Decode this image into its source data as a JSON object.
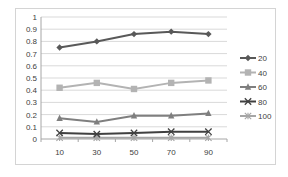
{
  "chart_data": {
    "type": "line",
    "title": "",
    "xlabel": "",
    "ylabel": "",
    "categories": [
      "10",
      "30",
      "50",
      "70",
      "90"
    ],
    "ylim": [
      0,
      1
    ],
    "yticks": [
      "0",
      "0.1",
      "0.2",
      "0.3",
      "0.4",
      "0.5",
      "0.6",
      "0.7",
      "0.8",
      "0.9",
      "1"
    ],
    "grid": true,
    "legend_position": "right",
    "series": [
      {
        "name": "20",
        "color": "#595959",
        "marker": "diamond",
        "values": [
          0.75,
          0.8,
          0.86,
          0.88,
          0.86
        ]
      },
      {
        "name": "40",
        "color": "#b3b3b3",
        "marker": "square",
        "values": [
          0.42,
          0.46,
          0.41,
          0.46,
          0.48
        ]
      },
      {
        "name": "60",
        "color": "#7f7f7f",
        "marker": "triangle",
        "values": [
          0.17,
          0.14,
          0.19,
          0.19,
          0.21
        ]
      },
      {
        "name": "80",
        "color": "#404040",
        "marker": "x",
        "values": [
          0.05,
          0.04,
          0.05,
          0.06,
          0.06
        ]
      },
      {
        "name": "100",
        "color": "#a6a6a6",
        "marker": "star",
        "values": [
          0.01,
          0.01,
          0.01,
          0.01,
          0.01
        ]
      }
    ]
  }
}
